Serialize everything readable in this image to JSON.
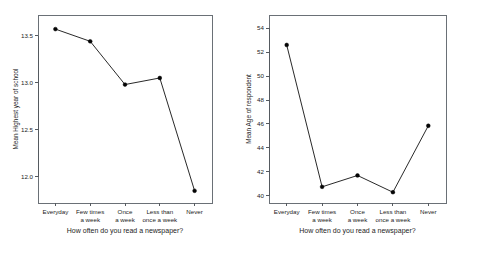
{
  "figure": {
    "background_color": "#ffffff",
    "panel_count": 2,
    "marker_color": "#050505",
    "line_color": "#111111",
    "axis_color": "#555a60"
  },
  "chart_data": [
    {
      "type": "line",
      "panel": "left",
      "title": "",
      "xlabel": "How often do you read a newspaper?",
      "ylabel": "Mean Highest year of school",
      "categories": [
        "Everyday",
        "Few times a week",
        "Once a week",
        "Less than once a week",
        "Never"
      ],
      "category_lines": [
        [
          "Everyday"
        ],
        [
          "Few times",
          "a week"
        ],
        [
          "Once",
          "a week"
        ],
        [
          "Less than",
          "once a week"
        ],
        [
          "Never"
        ]
      ],
      "values": [
        13.57,
        13.44,
        12.98,
        13.05,
        11.85
      ],
      "ylim": [
        11.72,
        13.72
      ],
      "yticks": [
        12.0,
        12.5,
        13.0,
        13.5
      ],
      "ytick_labels": [
        "12.0",
        "12.5",
        "13.0",
        "13.5"
      ],
      "grid": false,
      "legend": "none",
      "markers": "filled-circle"
    },
    {
      "type": "line",
      "panel": "right",
      "title": "",
      "xlabel": "How often do you read a newspaper?",
      "ylabel": "Mean Age of respondent",
      "categories": [
        "Everyday",
        "Few times a week",
        "Once a week",
        "Less than once a week",
        "Never"
      ],
      "category_lines": [
        [
          "Everyday"
        ],
        [
          "Few times",
          "a week"
        ],
        [
          "Once",
          "a week"
        ],
        [
          "Less than",
          "once a week"
        ],
        [
          "Never"
        ]
      ],
      "values": [
        52.6,
        40.75,
        41.7,
        40.3,
        45.85
      ],
      "ylim": [
        39.4,
        55.1
      ],
      "yticks": [
        40,
        42,
        44,
        46,
        48,
        50,
        52,
        54
      ],
      "ytick_labels": [
        "40",
        "42",
        "44",
        "46",
        "48",
        "50",
        "52",
        "54"
      ],
      "grid": false,
      "legend": "none",
      "markers": "filled-circle"
    }
  ]
}
